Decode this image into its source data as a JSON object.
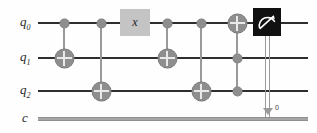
{
  "diagram": {
    "type": "quantum-circuit"
  },
  "wires": {
    "quantum": [
      {
        "id": "q0",
        "base": "q",
        "index": "0",
        "y": 22
      },
      {
        "id": "q1",
        "base": "q",
        "index": "1",
        "y": 57
      },
      {
        "id": "q2",
        "base": "q",
        "index": "2",
        "y": 90
      }
    ],
    "classical": [
      {
        "id": "c",
        "label": "c",
        "y": 118,
        "index_label": "0"
      }
    ]
  },
  "gates": [
    {
      "name": "cnot-1",
      "type": "cnot",
      "control": "q0",
      "target": "q1",
      "x": 64
    },
    {
      "name": "cnot-2",
      "type": "cnot",
      "control": "q0",
      "target": "q2",
      "x": 101
    },
    {
      "name": "x-gate",
      "type": "x",
      "label": "x",
      "target": "q0",
      "x": 135
    },
    {
      "name": "cnot-3",
      "type": "cnot",
      "control": "q0",
      "target": "q1",
      "x": 167
    },
    {
      "name": "cnot-4",
      "type": "cnot",
      "control": "q0",
      "target": "q2",
      "x": 201
    },
    {
      "name": "toffoli",
      "type": "toffoli",
      "controls": [
        "q1",
        "q2"
      ],
      "target": "q0",
      "x": 237
    },
    {
      "name": "measure",
      "type": "measure",
      "source": "q0",
      "destination": "c",
      "bit": "0",
      "x": 267
    }
  ],
  "colors": {
    "quantum_wire": "#2e2e2e",
    "classical_wire": "#a6a6a6",
    "gate_grey": "#8e8e8e",
    "x_gate_fill": "#c4c4c4",
    "measure_fill": "#111111",
    "link_line": "#9a9a9a",
    "background": "#fefefe"
  },
  "icons": {
    "measure": "meter-icon"
  }
}
